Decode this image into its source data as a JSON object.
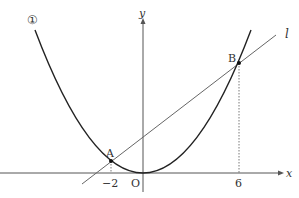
{
  "diagram": {
    "curve_label": "①",
    "axis_x_label": "x",
    "axis_y_label": "y",
    "origin_label": "O",
    "line_label": "l",
    "points": [
      {
        "name": "A",
        "x": -2
      },
      {
        "name": "B",
        "x": 6
      }
    ],
    "tick_labels": [
      "−2",
      "6"
    ],
    "colors": {
      "curve": "#222222",
      "line": "#666666",
      "axes": "#555555"
    }
  }
}
